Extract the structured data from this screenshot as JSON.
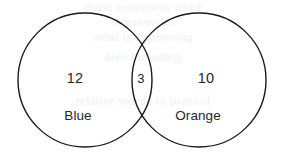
{
  "diagram": {
    "type": "venn-two-set",
    "background_color": "#ffffff",
    "stroke_color": "#1a1a1a",
    "text_color": "#262626",
    "sets": [
      {
        "id": "left",
        "name": "Blue",
        "count_label": "12",
        "count_value": 12,
        "center_x": 85,
        "center_y": 80,
        "radius": 67
      },
      {
        "id": "right",
        "name": "Orange",
        "count_label": "10",
        "count_value": 10,
        "center_x": 199,
        "center_y": 80,
        "radius": 67
      }
    ],
    "intersection": {
      "id": "both",
      "count_label": "3",
      "count_value": 3,
      "center_x": 141,
      "center_y": 78
    },
    "labels": {
      "left_count": "12",
      "left_name": "Blue",
      "intersection_count": "3",
      "right_count": "10",
      "right_name": "Orange"
    }
  },
  "watermark": {
    "visible": true,
    "color": "#f2f4f7",
    "lines": [
      "most commonly used",
      "in essential",
      "what is happening",
      "also including",
      "relative words to present"
    ]
  },
  "chart_data": {
    "type": "venn",
    "title": "",
    "categories": [
      "Blue",
      "Orange"
    ],
    "regions": [
      {
        "label": "Blue only",
        "sets": [
          "Blue"
        ],
        "value": 12
      },
      {
        "label": "Both",
        "sets": [
          "Blue",
          "Orange"
        ],
        "value": 3
      },
      {
        "label": "Orange only",
        "sets": [
          "Orange"
        ],
        "value": 10
      }
    ],
    "set_totals": [
      {
        "name": "Blue",
        "value": 15
      },
      {
        "name": "Orange",
        "value": 13
      }
    ],
    "total": 25,
    "xlabel": "",
    "ylabel": "",
    "legend": false,
    "grid": false
  }
}
